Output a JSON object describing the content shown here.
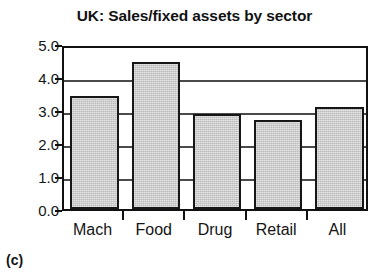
{
  "figure": {
    "caption": "(c)"
  },
  "chart_data": {
    "type": "bar",
    "title": "UK: Sales/fixed assets by sector",
    "xlabel": "",
    "ylabel": "",
    "categories": [
      "Mach",
      "Food",
      "Drug",
      "Retail",
      "All"
    ],
    "values": [
      3.42,
      4.45,
      2.88,
      2.7,
      3.1
    ],
    "ylim": [
      0.0,
      5.0
    ],
    "ytick_labels": [
      "5.0",
      "4.0",
      "3.0",
      "2.0",
      "1.0",
      "0.0"
    ],
    "ytick_values": [
      5.0,
      4.0,
      3.0,
      2.0,
      1.0,
      0.0
    ],
    "grid": true,
    "legend": false,
    "colors": {
      "bar_fill": "#c9c9c9",
      "bar_edge": "#161616",
      "gridline": "#4a4a4a",
      "axis": "#111111",
      "text": "#141414",
      "background": "#ffffff"
    }
  }
}
